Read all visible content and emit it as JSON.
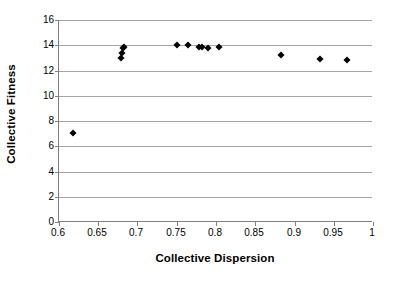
{
  "chart_data": {
    "type": "scatter",
    "title": "",
    "xlabel": "Collective Dispersion",
    "ylabel": "Collective Fitness",
    "xlim": [
      0.6,
      1.0
    ],
    "ylim": [
      0,
      16
    ],
    "xticks": [
      "0.6",
      "0.65",
      "0.7",
      "0.75",
      "0.8",
      "0.85",
      "0.9",
      "0.95",
      "1"
    ],
    "xtick_values": [
      0.6,
      0.65,
      0.7,
      0.75,
      0.8,
      0.85,
      0.9,
      0.95,
      1.0
    ],
    "yticks": [
      "16",
      "14",
      "12",
      "10",
      "8",
      "6",
      "4",
      "2",
      "0"
    ],
    "ytick_values": [
      16,
      14,
      12,
      10,
      8,
      6,
      4,
      2,
      0
    ],
    "grid": "horizontal",
    "legend": "none",
    "marker": "diamond",
    "marker_color": "#000000",
    "series": [
      {
        "name": "Collective Fitness vs Collective Dispersion",
        "points": [
          {
            "x": 0.618,
            "y": 7.05
          },
          {
            "x": 0.679,
            "y": 13.0
          },
          {
            "x": 0.68,
            "y": 13.4
          },
          {
            "x": 0.681,
            "y": 13.75
          },
          {
            "x": 0.683,
            "y": 13.85
          },
          {
            "x": 0.75,
            "y": 14.0
          },
          {
            "x": 0.764,
            "y": 14.05
          },
          {
            "x": 0.778,
            "y": 13.9
          },
          {
            "x": 0.782,
            "y": 13.85
          },
          {
            "x": 0.79,
            "y": 13.8
          },
          {
            "x": 0.804,
            "y": 13.85
          },
          {
            "x": 0.883,
            "y": 13.25
          },
          {
            "x": 0.932,
            "y": 12.9
          },
          {
            "x": 0.967,
            "y": 12.8
          }
        ]
      }
    ]
  }
}
